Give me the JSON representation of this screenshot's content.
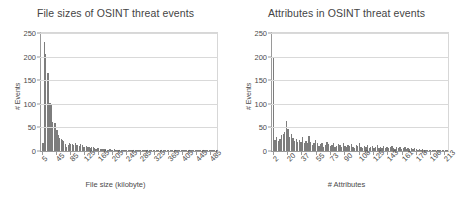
{
  "figure": {
    "background": "#ffffff",
    "bar_color": "#7d7d7d",
    "axis_color": "#9a9a9a",
    "grid_color": "#d9d9d9"
  },
  "chart_data": [
    {
      "type": "bar",
      "panel": "left",
      "title": "File sizes of OSINT threat events",
      "xlabel": "File size (kilobyte)",
      "ylabel": "# Events",
      "grid": true,
      "legend": "none",
      "ylim": [
        0,
        250
      ],
      "yticks": [
        0,
        50,
        100,
        150,
        200,
        250
      ],
      "xlim": [
        1,
        505
      ],
      "xticks": [
        5,
        45,
        85,
        125,
        165,
        205,
        245,
        285,
        325,
        365,
        405,
        445,
        485
      ],
      "x": [
        5,
        9,
        13,
        17,
        21,
        25,
        29,
        33,
        37,
        41,
        45,
        49,
        53,
        57,
        61,
        65,
        69,
        73,
        77,
        81,
        85,
        89,
        93,
        97,
        101,
        105,
        109,
        113,
        117,
        121,
        125,
        129,
        133,
        137,
        141,
        145,
        149,
        153,
        157,
        161,
        165,
        169,
        173,
        177,
        181,
        185,
        189,
        193,
        197,
        201,
        205,
        209,
        213,
        217,
        221,
        225,
        229,
        233,
        237,
        241,
        245,
        249,
        253,
        257,
        261,
        265,
        269,
        273,
        277,
        281,
        285,
        289,
        293,
        297,
        301,
        305,
        309,
        313,
        317,
        321,
        325,
        329,
        333,
        337,
        341,
        345,
        349,
        353,
        357,
        361,
        365,
        369,
        373,
        377,
        381,
        385,
        389,
        393,
        397,
        401,
        405,
        409,
        413,
        417,
        421,
        425,
        429,
        433,
        437,
        441,
        445,
        449,
        453,
        457,
        461,
        465,
        469,
        473,
        477,
        481,
        485,
        489,
        493,
        497,
        501
      ],
      "values": [
        18,
        231,
        205,
        166,
        165,
        101,
        98,
        62,
        60,
        59,
        44,
        33,
        28,
        25,
        24,
        22,
        14,
        8,
        13,
        16,
        15,
        14,
        13,
        16,
        13,
        12,
        10,
        14,
        12,
        9,
        8,
        10,
        9,
        9,
        7,
        8,
        8,
        6,
        5,
        6,
        7,
        5,
        4,
        4,
        5,
        4,
        3,
        3,
        4,
        3,
        3,
        4,
        3,
        2,
        3,
        3,
        2,
        3,
        2,
        2,
        3,
        2,
        2,
        2,
        3,
        2,
        2,
        1,
        2,
        2,
        2,
        1,
        2,
        2,
        1,
        2,
        1,
        1,
        2,
        1,
        1,
        2,
        1,
        1,
        1,
        1,
        2,
        1,
        1,
        1,
        1,
        1,
        1,
        1,
        1,
        1,
        1,
        1,
        1,
        1,
        1,
        1,
        1,
        1,
        1,
        1,
        1,
        1,
        1,
        1,
        1,
        1,
        1,
        1,
        1,
        1,
        1,
        1,
        1,
        1,
        1,
        1,
        1,
        1,
        1
      ]
    },
    {
      "type": "bar",
      "panel": "right",
      "title": "Attributes in OSINT threat events",
      "xlabel": "# Attributes",
      "ylabel": "# Events",
      "grid": true,
      "legend": "none",
      "ylim": [
        0,
        250
      ],
      "yticks": [
        0,
        50,
        100,
        150,
        200,
        250
      ],
      "xlim": [
        1,
        218
      ],
      "xticks": [
        2,
        20,
        37,
        55,
        73,
        90,
        108,
        125,
        143,
        161,
        178,
        196,
        213
      ],
      "x": [
        2,
        4,
        6,
        8,
        10,
        12,
        14,
        16,
        18,
        20,
        22,
        24,
        26,
        28,
        30,
        32,
        34,
        36,
        38,
        40,
        42,
        44,
        46,
        48,
        50,
        52,
        54,
        56,
        58,
        60,
        62,
        64,
        66,
        68,
        70,
        72,
        74,
        76,
        78,
        80,
        82,
        84,
        86,
        88,
        90,
        92,
        94,
        96,
        98,
        100,
        102,
        104,
        106,
        108,
        110,
        112,
        114,
        116,
        118,
        120,
        122,
        124,
        126,
        128,
        130,
        132,
        134,
        136,
        138,
        140,
        142,
        144,
        146,
        148,
        150,
        152,
        154,
        156,
        158,
        160,
        162,
        164,
        166,
        168,
        170,
        172,
        174,
        176,
        178,
        180,
        182,
        184,
        186,
        188,
        190,
        192,
        194,
        196,
        198,
        200,
        202,
        204,
        206,
        208,
        210,
        212,
        214,
        216
      ],
      "values": [
        198,
        24,
        30,
        22,
        26,
        33,
        36,
        40,
        63,
        46,
        30,
        36,
        28,
        22,
        26,
        20,
        24,
        20,
        30,
        18,
        22,
        16,
        32,
        20,
        12,
        16,
        24,
        18,
        10,
        14,
        18,
        8,
        12,
        20,
        14,
        10,
        12,
        16,
        8,
        10,
        14,
        12,
        8,
        16,
        10,
        8,
        12,
        10,
        14,
        8,
        6,
        12,
        10,
        18,
        8,
        6,
        10,
        8,
        12,
        6,
        8,
        10,
        6,
        8,
        12,
        6,
        8,
        6,
        10,
        6,
        8,
        6,
        8,
        10,
        6,
        4,
        8,
        6,
        8,
        4,
        6,
        8,
        4,
        6,
        4,
        6,
        4,
        6,
        4,
        3,
        4,
        3,
        4,
        3,
        2,
        3,
        2,
        3,
        2,
        2,
        2,
        2,
        2,
        1,
        2,
        1,
        2,
        1
      ]
    }
  ]
}
